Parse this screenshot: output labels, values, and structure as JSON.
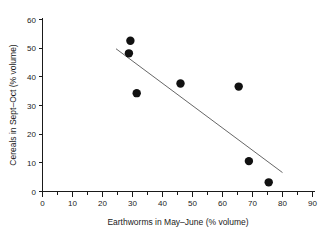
{
  "chart_data": {
    "type": "scatter",
    "title": "",
    "subtitle": "",
    "xlabel": "Earthworms in May–June (% volume)",
    "ylabel": "Cereals in Sept–Oct (% volume)",
    "xlim": [
      0,
      90
    ],
    "ylim": [
      0,
      60
    ],
    "xticks": [
      0,
      10,
      20,
      30,
      40,
      50,
      60,
      70,
      80,
      90
    ],
    "yticks": [
      0,
      10,
      20,
      30,
      40,
      50,
      60
    ],
    "xtick_labels": [
      "0",
      "10",
      "20",
      "30",
      "40",
      "50",
      "60",
      "70",
      "80",
      "90"
    ],
    "ytick_labels": [
      "0",
      "10",
      "20",
      "30",
      "40",
      "50",
      "60"
    ],
    "x_minor_tick_step": 5,
    "grid": false,
    "legend": null,
    "legend_position": "none",
    "marker": "filled-circle",
    "marker_color": "#111111",
    "marker_size": 4.2,
    "points": [
      {
        "x": 29.3,
        "y": 52.6
      },
      {
        "x": 28.8,
        "y": 48.2
      },
      {
        "x": 31.4,
        "y": 34.3
      },
      {
        "x": 46.0,
        "y": 37.7
      },
      {
        "x": 65.4,
        "y": 36.6
      },
      {
        "x": 68.8,
        "y": 10.6
      },
      {
        "x": 75.4,
        "y": 3.2
      }
    ],
    "series": [
      {
        "name": "observations",
        "x": [
          29.3,
          28.8,
          31.4,
          46.0,
          65.4,
          68.8,
          75.4
        ],
        "y": [
          52.6,
          48.2,
          34.3,
          37.7,
          36.6,
          10.6,
          3.2
        ]
      }
    ],
    "annotations": [
      {
        "type": "regression-line",
        "label": "fitted trend line",
        "color": "#555555",
        "x_start": 24.5,
        "y_start": 49.8,
        "x_end": 80.0,
        "y_end": 6.6
      }
    ]
  },
  "axes": {
    "x_axis_name": "earthworms-axis",
    "y_axis_name": "cereals-axis"
  }
}
